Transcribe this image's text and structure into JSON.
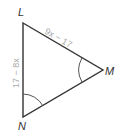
{
  "diagram": {
    "type": "triangle",
    "vertices": {
      "L": {
        "label": "L",
        "x": 23,
        "y": 23
      },
      "M": {
        "label": "M",
        "x": 103,
        "y": 70
      },
      "N": {
        "label": "N",
        "x": 23,
        "y": 117
      }
    },
    "sides": {
      "LM": {
        "label": "9x − 17"
      },
      "LN": {
        "label": "17 − 8x"
      }
    },
    "marked_angles": [
      "M",
      "N"
    ],
    "colors": {
      "stroke": "#333333",
      "side_label": "#aaaaaa",
      "vertex_label": "#333333"
    }
  }
}
